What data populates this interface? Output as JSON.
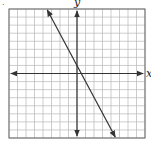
{
  "chart_data": {
    "type": "line",
    "title": "",
    "xlabel": "x",
    "ylabel": "y",
    "xlim": [
      -8,
      8
    ],
    "ylim": [
      -8,
      8
    ],
    "grid": true,
    "grid_step": 1,
    "series": [
      {
        "name": "line",
        "equation": "y = -2x + 1",
        "x": [
          -3.5,
          4.5
        ],
        "y": [
          8,
          -8
        ],
        "arrows_both_ends": true
      }
    ]
  },
  "labels": {
    "marker": ".",
    "y_axis": "y",
    "x_axis": "x"
  },
  "colors": {
    "grid": "#b8b8b8",
    "axis": "#333333",
    "line": "#333333",
    "frame": "#666666"
  }
}
